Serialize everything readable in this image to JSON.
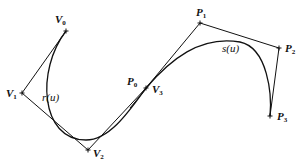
{
  "diagram": {
    "title": "",
    "curves": [
      {
        "name": "r(u)",
        "label": "r(u)",
        "label_pos": [
          42,
          101
        ],
        "path": "M66,31 C 36,70 40,140 86,140 C 110,140 130,110 146,88"
      },
      {
        "name": "s(u)",
        "label": "s(u)",
        "label_pos": [
          222,
          52
        ],
        "path": "M146,88 C 170,60 200,35 240,42 C 268,48 272,95 270,116"
      }
    ],
    "control_polygons": [
      {
        "name": "V-polygon",
        "points": [
          [
            66,
            31
          ],
          [
            22,
            93
          ],
          [
            88,
            150
          ],
          [
            146,
            88
          ]
        ]
      },
      {
        "name": "P-polygon",
        "points": [
          [
            146,
            88
          ],
          [
            200,
            23
          ],
          [
            279,
            48
          ],
          [
            270,
            116
          ]
        ]
      }
    ],
    "extension_line": {
      "points": [
        [
          130,
          108
        ],
        [
          150,
          84
        ]
      ]
    },
    "vertices": [
      {
        "id": "V0",
        "base": "V",
        "sub": "0",
        "pt": [
          66,
          31
        ],
        "label_pos": [
          55,
          23
        ]
      },
      {
        "id": "V1",
        "base": "V",
        "sub": "1",
        "pt": [
          22,
          93
        ],
        "label_pos": [
          6,
          97
        ]
      },
      {
        "id": "V2",
        "base": "V",
        "sub": "2",
        "pt": [
          88,
          150
        ],
        "label_pos": [
          93,
          157
        ]
      },
      {
        "id": "V3",
        "base": "V",
        "sub": "3",
        "pt": [
          146,
          88
        ],
        "label_pos": [
          152,
          93
        ]
      },
      {
        "id": "P0",
        "base": "P",
        "sub": "0",
        "pt": [
          146,
          88
        ],
        "label_pos": [
          127,
          85
        ]
      },
      {
        "id": "P1",
        "base": "P",
        "sub": "1",
        "pt": [
          200,
          23
        ],
        "label_pos": [
          196,
          16
        ]
      },
      {
        "id": "P2",
        "base": "P",
        "sub": "2",
        "pt": [
          279,
          48
        ],
        "label_pos": [
          285,
          52
        ]
      },
      {
        "id": "P3",
        "base": "P",
        "sub": "3",
        "pt": [
          270,
          116
        ],
        "label_pos": [
          277,
          120
        ]
      }
    ]
  }
}
